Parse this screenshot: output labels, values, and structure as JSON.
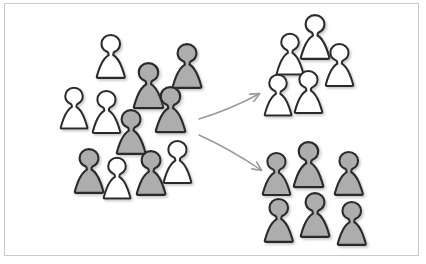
{
  "diagram": {
    "frame": {
      "border_color": "#c9c9cc",
      "background_color": "#ffffff"
    },
    "palette": {
      "outline": "#2b2b2b",
      "fill_white": "#ffffff",
      "fill_gray": "#adadad",
      "shadow": "#c8c8c8",
      "arrow": "#9a9a9a"
    },
    "groups": [
      {
        "name": "mixed-cluster",
        "label": "Mixed cluster",
        "count": 13,
        "white_count": 6,
        "gray_count": 7,
        "figures": [
          {
            "id": "mixed-1",
            "type": "white",
            "x": 96,
            "y": 32,
            "scale": 1.0
          },
          {
            "id": "mixed-2",
            "type": "gray",
            "x": 133,
            "y": 60,
            "scale": 1.05
          },
          {
            "id": "mixed-3",
            "type": "gray",
            "x": 172,
            "y": 41,
            "scale": 1.02
          },
          {
            "id": "mixed-4",
            "type": "white",
            "x": 60,
            "y": 85,
            "scale": 0.95
          },
          {
            "id": "mixed-5",
            "type": "white",
            "x": 92,
            "y": 88,
            "scale": 0.98
          },
          {
            "id": "mixed-6",
            "type": "gray",
            "x": 155,
            "y": 84,
            "scale": 1.05
          },
          {
            "id": "mixed-7",
            "type": "gray",
            "x": 116,
            "y": 107,
            "scale": 1.02
          },
          {
            "id": "mixed-8",
            "type": "gray",
            "x": 74,
            "y": 146,
            "scale": 1.02
          },
          {
            "id": "mixed-9",
            "type": "white",
            "x": 103,
            "y": 155,
            "scale": 0.95
          },
          {
            "id": "mixed-10",
            "type": "gray",
            "x": 136,
            "y": 148,
            "scale": 1.02
          },
          {
            "id": "mixed-11",
            "type": "white",
            "x": 163,
            "y": 138,
            "scale": 0.98
          }
        ]
      },
      {
        "name": "white-group",
        "label": "White group",
        "count": 5,
        "white_count": 5,
        "gray_count": 0,
        "figures": [
          {
            "id": "white-1",
            "type": "white",
            "x": 300,
            "y": 12,
            "scale": 1.02
          },
          {
            "id": "white-2",
            "type": "white",
            "x": 276,
            "y": 31,
            "scale": 0.95
          },
          {
            "id": "white-3",
            "type": "white",
            "x": 325,
            "y": 41,
            "scale": 0.98
          },
          {
            "id": "white-4",
            "type": "white",
            "x": 264,
            "y": 72,
            "scale": 0.95
          },
          {
            "id": "white-5",
            "type": "white",
            "x": 294,
            "y": 68,
            "scale": 0.98
          }
        ]
      },
      {
        "name": "gray-group",
        "label": "Gray group",
        "count": 6,
        "white_count": 0,
        "gray_count": 6,
        "figures": [
          {
            "id": "gray-1",
            "type": "gray",
            "x": 262,
            "y": 150,
            "scale": 0.98
          },
          {
            "id": "gray-2",
            "type": "gray",
            "x": 293,
            "y": 139,
            "scale": 1.05
          },
          {
            "id": "gray-3",
            "type": "gray",
            "x": 334,
            "y": 149,
            "scale": 1.0
          },
          {
            "id": "gray-4",
            "type": "gray",
            "x": 264,
            "y": 196,
            "scale": 1.0
          },
          {
            "id": "gray-5",
            "type": "gray",
            "x": 300,
            "y": 190,
            "scale": 1.02
          },
          {
            "id": "gray-6",
            "type": "gray",
            "x": 337,
            "y": 199,
            "scale": 1.0
          }
        ]
      }
    ],
    "arrows": [
      {
        "id": "arrow-to-white-group",
        "label": "Arrow to white group",
        "from": {
          "x": 199,
          "y": 119
        },
        "to": {
          "x": 259,
          "y": 94
        }
      },
      {
        "id": "arrow-to-gray-group",
        "label": "Arrow to gray group",
        "from": {
          "x": 199,
          "y": 135
        },
        "to": {
          "x": 261,
          "y": 170
        }
      }
    ]
  }
}
